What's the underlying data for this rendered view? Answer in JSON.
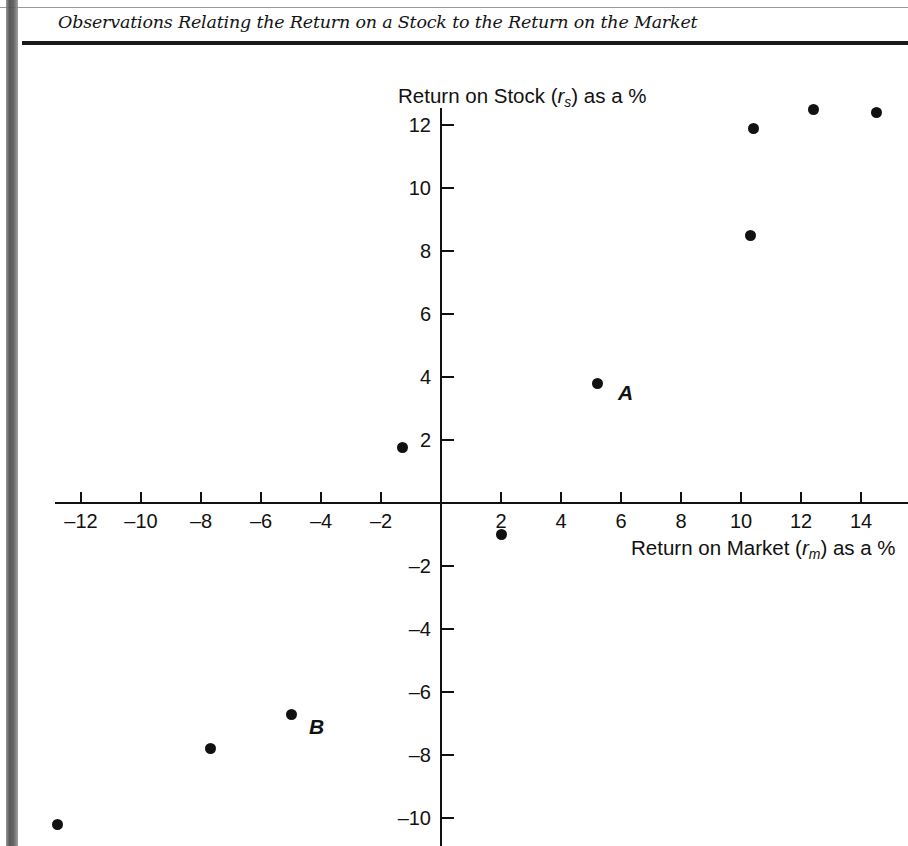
{
  "figure": {
    "title": "Observations Relating the Return on a Stock to the Return on the Market"
  },
  "chart_data": {
    "type": "scatter",
    "title": "Observations Relating the Return on a Stock to the Return on the Market",
    "xlabel": "Return on Market (rm) as a %",
    "ylabel": "Return on Stock (rs) as a %",
    "xlabel_parts": {
      "prefix": "Return on Market (",
      "var": "r",
      "sub": "m",
      "suffix": ") as a %"
    },
    "ylabel_parts": {
      "prefix": "Return on Stock (",
      "var": "r",
      "sub": "s",
      "suffix": ") as a %"
    },
    "xlim": [
      -13.5,
      15.5
    ],
    "ylim": [
      -11.0,
      13.2
    ],
    "xticks": [
      -12,
      -10,
      -8,
      -6,
      -4,
      -2,
      2,
      4,
      6,
      8,
      10,
      12,
      14
    ],
    "yticks": [
      12,
      10,
      8,
      6,
      4,
      2,
      -2,
      -4,
      -6,
      -8,
      -10
    ],
    "xtick_labels": [
      "–12",
      "–10",
      "–8",
      "–6",
      "–4",
      "–2",
      "2",
      "4",
      "6",
      "8",
      "10",
      "12",
      "14"
    ],
    "ytick_labels": [
      "12",
      "10",
      "8",
      "6",
      "4",
      "2",
      "–2",
      "–4",
      "–6",
      "–8",
      "–10"
    ],
    "grid": false,
    "legend": null,
    "axes_style": "centered-cross",
    "marker": {
      "shape": "circle",
      "color": "#111111",
      "size_px": 11
    },
    "points": [
      {
        "x": 14.5,
        "y": 12.4,
        "label": ""
      },
      {
        "x": 12.4,
        "y": 12.5,
        "label": ""
      },
      {
        "x": 10.4,
        "y": 11.9,
        "label": ""
      },
      {
        "x": 10.3,
        "y": 8.5,
        "label": ""
      },
      {
        "x": 5.2,
        "y": 3.8,
        "label": "A"
      },
      {
        "x": -1.3,
        "y": 1.75,
        "label": ""
      },
      {
        "x": 2.0,
        "y": -1.0,
        "label": ""
      },
      {
        "x": -5.0,
        "y": -6.7,
        "label": "B"
      },
      {
        "x": -7.7,
        "y": -7.8,
        "label": ""
      },
      {
        "x": -12.8,
        "y": -10.2,
        "label": ""
      }
    ],
    "annotations": [
      {
        "text": "A",
        "x": 5.9,
        "y": 3.5
      },
      {
        "text": "B",
        "x": -4.4,
        "y": -7.1
      }
    ]
  }
}
